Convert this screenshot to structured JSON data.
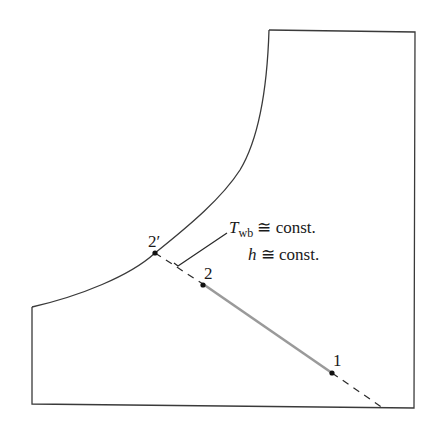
{
  "diagram": {
    "type": "psychrometric-process-sketch",
    "colors": {
      "outline": "#3a3a3a",
      "process_line": "#9a9a9a",
      "dashed_line": "#2a2a2a",
      "points": "#111111"
    },
    "points": [
      {
        "id": "1",
        "label": "1"
      },
      {
        "id": "2",
        "label": "2"
      },
      {
        "id": "2prime",
        "label": "2′"
      }
    ],
    "annotation": {
      "line1_main": "T",
      "line1_sub": "wb",
      "line1_rest": " ≅ const.",
      "line2_main": "h",
      "line2_rest": " ≅ const."
    }
  }
}
